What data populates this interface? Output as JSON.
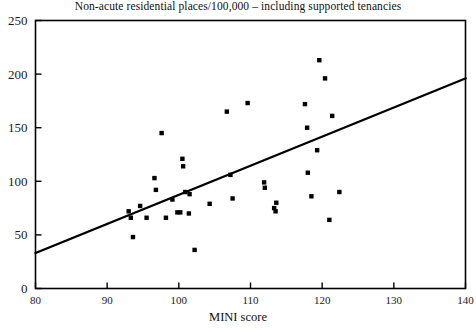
{
  "chart_data": {
    "type": "scatter",
    "title": "Non-acute residential places/100,000 – including supported tenancies",
    "xlabel": "MINI score",
    "ylabel": "",
    "xlim": [
      80,
      140
    ],
    "ylim": [
      0,
      250
    ],
    "xticks": [
      80,
      90,
      100,
      110,
      120,
      130,
      140
    ],
    "yticks": [
      0,
      50,
      100,
      150,
      200,
      250
    ],
    "grid": false,
    "legend": null,
    "marker": "square",
    "marker_color": "#000000",
    "series": [
      {
        "name": "Non-acute residential places per 100,000",
        "points": [
          [
            93.0,
            72
          ],
          [
            93.3,
            66
          ],
          [
            93.6,
            48
          ],
          [
            94.6,
            77
          ],
          [
            95.5,
            66
          ],
          [
            96.6,
            103
          ],
          [
            96.8,
            92
          ],
          [
            97.6,
            145
          ],
          [
            98.2,
            66
          ],
          [
            99.1,
            83
          ],
          [
            99.8,
            71
          ],
          [
            100.2,
            71
          ],
          [
            100.5,
            121
          ],
          [
            100.6,
            114
          ],
          [
            100.9,
            90
          ],
          [
            101.4,
            70
          ],
          [
            101.5,
            88
          ],
          [
            102.2,
            36
          ],
          [
            104.3,
            79
          ],
          [
            106.7,
            165
          ],
          [
            107.2,
            106
          ],
          [
            107.5,
            84
          ],
          [
            109.6,
            173
          ],
          [
            111.9,
            99
          ],
          [
            112.0,
            94
          ],
          [
            113.3,
            75
          ],
          [
            113.5,
            72
          ],
          [
            113.6,
            80
          ],
          [
            117.6,
            172
          ],
          [
            117.9,
            150
          ],
          [
            118.0,
            108
          ],
          [
            118.5,
            86
          ],
          [
            119.3,
            129
          ],
          [
            119.6,
            213
          ],
          [
            120.4,
            196
          ],
          [
            121.0,
            64
          ],
          [
            121.4,
            161
          ],
          [
            122.4,
            90
          ]
        ]
      }
    ],
    "trendline": {
      "name": "linear fit",
      "x0": 80,
      "y0": 33,
      "x1": 140,
      "y1": 196,
      "color": "#000000"
    }
  },
  "axes": {
    "y_tick_labels": [
      "250",
      "200",
      "150",
      "100",
      "50",
      "0"
    ],
    "x_tick_labels": [
      "80",
      "90",
      "100",
      "110",
      "120",
      "130",
      "140"
    ]
  }
}
